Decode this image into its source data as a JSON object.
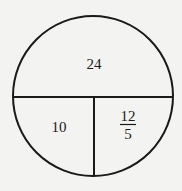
{
  "diagram": {
    "shape": "circle divided into three regions",
    "colors": {
      "background": "#f3f3f1",
      "stroke": "#1a1a1a"
    },
    "regions": [
      {
        "id": "top",
        "label": "24"
      },
      {
        "id": "bottom-left",
        "label": "10"
      },
      {
        "id": "bottom-right",
        "label": {
          "numerator": "12",
          "denominator": "5"
        }
      }
    ]
  }
}
